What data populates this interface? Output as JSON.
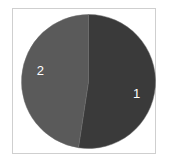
{
  "chart_data": {
    "type": "pie",
    "title": "",
    "start": "top",
    "direction": "clockwise",
    "slices": [
      {
        "label": "1",
        "value": 52.4,
        "color": "#3a3a3a"
      },
      {
        "label": "2",
        "value": 47.6,
        "color": "#5a5a5a"
      }
    ],
    "legend": "none"
  }
}
